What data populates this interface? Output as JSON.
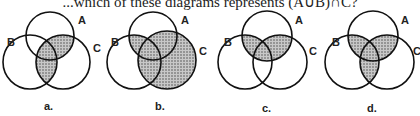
{
  "question": {
    "text": "...which of these diagrams represents (A∪B)∩C?"
  },
  "diagrams": [
    {
      "label": "a.",
      "set_labels": [
        "A",
        "B",
        "C"
      ],
      "shaded": [
        "A∩C",
        "B∩C"
      ]
    },
    {
      "label": "b.",
      "set_labels": [
        "A",
        "B",
        "C"
      ],
      "shaded": [
        "A∩B",
        "C"
      ]
    },
    {
      "label": "c.",
      "set_labels": [
        "A",
        "B",
        "C"
      ],
      "shaded": [
        "A∩B",
        "A∩C"
      ]
    },
    {
      "label": "d.",
      "set_labels": [
        "A",
        "B",
        "C"
      ],
      "shaded": [
        "A∩B",
        "A∩C",
        "B∩C"
      ]
    }
  ],
  "colors": {
    "stroke": "#111111",
    "shade": "#9a9a9a",
    "background": "#ffffff"
  }
}
